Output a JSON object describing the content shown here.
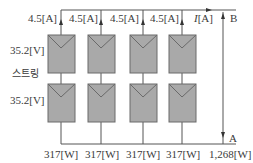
{
  "diagram": {
    "type": "pv-array-wiring",
    "strings": 4,
    "modules_per_string": 2,
    "current_labels": [
      "4.5[A]",
      "4.5[A]",
      "4.5[A]",
      "4.5[A]"
    ],
    "total_current_label": "I[A]",
    "total_current_symbol": "I",
    "total_current_unit": "[A]",
    "module_voltage_top": "35.2[V]",
    "string_label": "스트링",
    "module_voltage_bottom": "35.2[V]",
    "string_power_labels": [
      "317[W]",
      "317[W]",
      "317[W]",
      "317[W]"
    ],
    "total_power_label": "1,268[W]",
    "terminal_top": "B",
    "terminal_bottom": "A",
    "colors": {
      "module_fill": "#a9a9a9",
      "module_stroke": "#6a6a6a",
      "wire": "#555555",
      "text": "#3a3a3a"
    }
  }
}
